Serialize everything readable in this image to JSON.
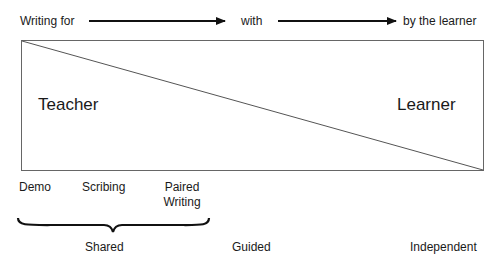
{
  "top_row": {
    "start": "Writing for",
    "middle": "with",
    "end": "by the learner"
  },
  "box": {
    "left_label": "Teacher",
    "right_label": "Learner"
  },
  "stages": [
    {
      "label": "Demo"
    },
    {
      "label": "Scribing"
    },
    {
      "label_line1": "Paired",
      "label_line2": "Writing"
    }
  ],
  "categories": [
    {
      "label": "Shared"
    },
    {
      "label": "Guided"
    },
    {
      "label": "Independent"
    }
  ],
  "colors": {
    "line": "#555555",
    "arrow": "#111111",
    "text": "#1a1a1a"
  }
}
